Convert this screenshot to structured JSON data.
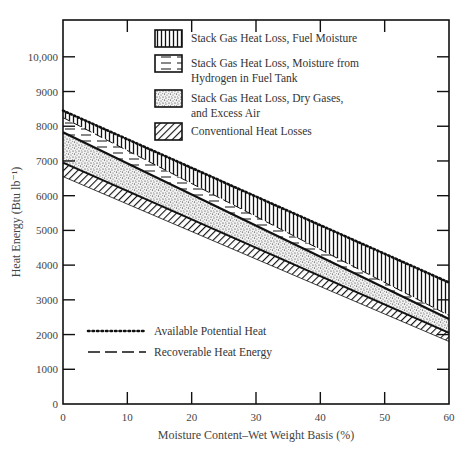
{
  "chart_data": {
    "type": "area",
    "title": "",
    "xlabel": "Moisture Content–Wet Weight Basis (%)",
    "ylabel": "Heat Energy (Btu lb⁻¹)",
    "xlim": [
      0,
      60
    ],
    "ylim": [
      0,
      11000
    ],
    "x_ticks": [
      0,
      10,
      20,
      30,
      40,
      50,
      60
    ],
    "x_tick_labels": [
      "0",
      "10",
      "20",
      "30",
      "40",
      "50",
      "60"
    ],
    "y_ticks": [
      0,
      1000,
      2000,
      3000,
      4000,
      5000,
      6000,
      7000,
      8000,
      9000,
      10000
    ],
    "y_tick_labels": [
      "0",
      "1000",
      "2000",
      "3000",
      "4000",
      "5000",
      "6000",
      "7000",
      "8000",
      "9000",
      "10,000"
    ],
    "grid": false,
    "x": [
      0,
      60
    ],
    "boundaries": [
      {
        "name": "Available Potential Heat",
        "values": [
          8450,
          3500
        ]
      },
      {
        "name": "Fuel Moisture band lower edge",
        "values": [
          8250,
          2550
        ]
      },
      {
        "name": "Recoverable Heat Energy",
        "values": [
          7830,
          2450
        ]
      },
      {
        "name": "Dry Gases band lower edge",
        "values": [
          6950,
          2050
        ]
      },
      {
        "name": "Conventional losses lower edge",
        "values": [
          6550,
          1800
        ]
      }
    ],
    "series": [
      {
        "name": "Stack Gas Heat Loss, Fuel Moisture",
        "pattern": "vertical-lines",
        "upper": [
          8450,
          3500
        ],
        "lower": [
          8250,
          2550
        ]
      },
      {
        "name": "Stack Gas Heat Loss, Moisture from Hydrogen in Fuel Tank",
        "pattern": "dashes",
        "upper": [
          8250,
          2550
        ],
        "lower": [
          7830,
          2450
        ]
      },
      {
        "name": "Stack Gas Heat Loss, Dry Gases, and Excess Air",
        "pattern": "stipple",
        "upper": [
          7830,
          2450
        ],
        "lower": [
          6950,
          2050
        ]
      },
      {
        "name": "Conventional Heat Losses",
        "pattern": "diagonal-hatch",
        "upper": [
          6950,
          2050
        ],
        "lower": [
          6550,
          1800
        ]
      }
    ],
    "legend": {
      "placement": "top-center",
      "entries": [
        {
          "label_lines": [
            "Stack Gas Heat Loss, Fuel Moisture"
          ],
          "pattern": "vertical-lines"
        },
        {
          "label_lines": [
            "Stack Gas Heat Loss, Moisture from",
            "Hydrogen in Fuel Tank"
          ],
          "pattern": "dashes"
        },
        {
          "label_lines": [
            "Stack Gas Heat Loss, Dry Gases,",
            "and Excess Air"
          ],
          "pattern": "stipple"
        },
        {
          "label_lines": [
            "Conventional Heat Losses"
          ],
          "pattern": "diagonal-hatch"
        }
      ]
    },
    "line_legend": {
      "placement": "bottom-left",
      "entries": [
        {
          "label": "Available Potential Heat",
          "style": "dotted"
        },
        {
          "label": "Recoverable Heat Energy",
          "style": "dashed"
        }
      ]
    },
    "colors": {
      "ink": "#111111",
      "text": "#444444",
      "background": "#ffffff"
    }
  }
}
